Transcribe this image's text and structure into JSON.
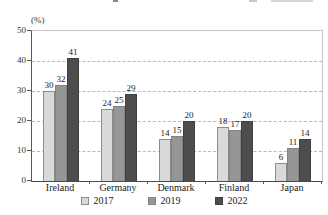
{
  "chart_data": {
    "type": "bar",
    "title": "",
    "categories": [
      "Ireland",
      "Germany",
      "Denmark",
      "Finland",
      "Japan"
    ],
    "series": [
      {
        "name": "2017",
        "color": "#d9d9d9",
        "border": "#8c8c8c",
        "values": [
          30,
          24,
          14,
          18,
          6
        ]
      },
      {
        "name": "2019",
        "color": "#969696",
        "border": "#828282",
        "values": [
          32,
          25,
          15,
          17,
          11
        ]
      },
      {
        "name": "2022",
        "color": "#4d4d4d",
        "border": "#404040",
        "values": [
          41,
          29,
          20,
          20,
          14
        ]
      }
    ],
    "ylabel": "(%)",
    "xlabel": "",
    "ylim": [
      0,
      50
    ],
    "yticks": [
      0,
      10,
      20,
      30,
      40,
      50
    ],
    "grid": "horizontal-dashed",
    "legend_position": "bottom",
    "bar_value_labels": true
  },
  "style": {
    "axis_color": "#555555",
    "frame_color": "#c6c6c6",
    "grid_color": "#b8b8b8",
    "text_color": "#222222",
    "background": "#ffffff",
    "artifact_color": "#c9c9c9"
  }
}
